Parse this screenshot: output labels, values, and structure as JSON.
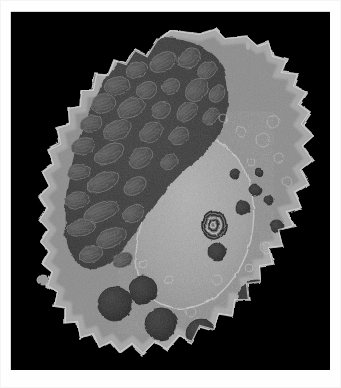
{
  "page": {
    "background_color": "#ffffff",
    "margin_rule_color": "#d8d8d8"
  },
  "figure": {
    "type": "transmission-electron-micrograph",
    "caption": "",
    "frame": {
      "x": 11,
      "y": 12,
      "width": 319,
      "height": 358,
      "background_color": "#000000"
    },
    "palette": {
      "background": "#000000",
      "cytoplasm_light": "#9d9d9d",
      "cytoplasm_mid": "#7e7e7e",
      "nucleus": "#a6a6a6",
      "organelle_field_dark": "#3d3d3d",
      "mitochondria": "#4a4a4a",
      "granules_dense": "#2a2a2a",
      "membrane_highlight": "#c9c9c9"
    },
    "regions": [
      {
        "name": "plasma-membrane-ruffles",
        "label": "Plasma membrane with filopodia / microvilli",
        "tone": "#b5b5b5"
      },
      {
        "name": "mitochondria-field",
        "label": "Dense field of mitochondria and rough ER",
        "tone": "#3f3f3f"
      },
      {
        "name": "nucleus",
        "label": "Nucleus with granular euchromatin",
        "tone": "#a8a8a8"
      },
      {
        "name": "dense-granules",
        "label": "Electron-dense secretory granules / lysosomes",
        "tone": "#2b2b2b"
      },
      {
        "name": "multilamellar-body",
        "label": "Multilamellar (myelin figure) body",
        "tone": "#555555"
      }
    ],
    "cell_outline": "M 160 18 L 188 22 L 205 17 L 214 26 L 236 24 L 247 34 L 258 30 L 262 44 L 276 48 L 271 60 L 287 62 L 283 74 L 296 80 L 288 92 L 299 100 L 291 112 L 303 124 L 292 134 L 302 148 L 290 158 L 298 172 L 284 180 L 291 196 L 276 200 L 283 214 L 268 218 L 272 234 L 258 236 L 262 252 L 249 254 L 250 270 L 236 272 L 238 288 L 224 288 L 222 304 L 208 302 L 203 318 L 189 314 L 181 330 L 168 324 L 156 338 L 144 330 L 132 342 L 121 332 L 109 341 L 100 330 L 88 336 L 82 322 L 69 326 L 66 310 L 54 311 L 54 296 L 43 294 L 46 280 L 36 274 L 41 260 L 31 252 L 38 240 L 29 230 L 37 218 L 28 208 L 36 196 L 28 184 L 38 174 L 31 160 L 42 152 L 37 138 L 49 132 L 46 116 L 58 112 L 57 96 L 69 94 L 70 78 L 82 78 L 85 62 L 97 63 L 103 48 L 115 52 L 124 38 L 136 44 L 146 28 Z",
    "mitochondria_ellipses": [
      {
        "cx": 152,
        "cy": 50,
        "rx": 14,
        "ry": 9,
        "rot": -28,
        "tone": "#4e4e4e"
      },
      {
        "cx": 126,
        "cy": 58,
        "rx": 11,
        "ry": 8,
        "rot": -20,
        "tone": "#4a4a4a"
      },
      {
        "cx": 178,
        "cy": 46,
        "rx": 12,
        "ry": 9,
        "rot": -35,
        "tone": "#535353"
      },
      {
        "cx": 196,
        "cy": 58,
        "rx": 10,
        "ry": 8,
        "rot": -40,
        "tone": "#4d4d4d"
      },
      {
        "cx": 106,
        "cy": 74,
        "rx": 13,
        "ry": 9,
        "rot": -15,
        "tone": "#4c4c4c"
      },
      {
        "cx": 136,
        "cy": 78,
        "rx": 10,
        "ry": 8,
        "rot": -30,
        "tone": "#474747"
      },
      {
        "cx": 160,
        "cy": 74,
        "rx": 9,
        "ry": 7,
        "rot": -25,
        "tone": "#4f4f4f"
      },
      {
        "cx": 186,
        "cy": 78,
        "rx": 13,
        "ry": 10,
        "rot": -45,
        "tone": "#505050"
      },
      {
        "cx": 206,
        "cy": 82,
        "rx": 9,
        "ry": 7,
        "rot": -50,
        "tone": "#484848"
      },
      {
        "cx": 92,
        "cy": 92,
        "rx": 12,
        "ry": 9,
        "rot": -18,
        "tone": "#4b4b4b"
      },
      {
        "cx": 120,
        "cy": 96,
        "rx": 14,
        "ry": 9,
        "rot": -24,
        "tone": "#464646"
      },
      {
        "cx": 150,
        "cy": 98,
        "rx": 10,
        "ry": 8,
        "rot": -32,
        "tone": "#4e4e4e"
      },
      {
        "cx": 176,
        "cy": 100,
        "rx": 11,
        "ry": 8,
        "rot": -38,
        "tone": "#4a4a4a"
      },
      {
        "cx": 200,
        "cy": 104,
        "rx": 9,
        "ry": 7,
        "rot": -44,
        "tone": "#444444"
      },
      {
        "cx": 80,
        "cy": 112,
        "rx": 11,
        "ry": 8,
        "rot": -12,
        "tone": "#494949"
      },
      {
        "cx": 106,
        "cy": 118,
        "rx": 15,
        "ry": 9,
        "rot": -26,
        "tone": "#4d4d4d"
      },
      {
        "cx": 140,
        "cy": 120,
        "rx": 12,
        "ry": 9,
        "rot": -30,
        "tone": "#474747"
      },
      {
        "cx": 168,
        "cy": 124,
        "rx": 10,
        "ry": 8,
        "rot": -36,
        "tone": "#4b4b4b"
      },
      {
        "cx": 72,
        "cy": 134,
        "rx": 12,
        "ry": 8,
        "rot": -14,
        "tone": "#4a4a4a"
      },
      {
        "cx": 98,
        "cy": 142,
        "rx": 16,
        "ry": 9,
        "rot": -28,
        "tone": "#505050"
      },
      {
        "cx": 130,
        "cy": 146,
        "rx": 13,
        "ry": 9,
        "rot": -34,
        "tone": "#464646"
      },
      {
        "cx": 158,
        "cy": 150,
        "rx": 9,
        "ry": 7,
        "rot": -40,
        "tone": "#4c4c4c"
      },
      {
        "cx": 68,
        "cy": 160,
        "rx": 11,
        "ry": 8,
        "rot": -10,
        "tone": "#484848"
      },
      {
        "cx": 92,
        "cy": 170,
        "rx": 17,
        "ry": 9,
        "rot": -26,
        "tone": "#4e4e4e"
      },
      {
        "cx": 124,
        "cy": 174,
        "rx": 12,
        "ry": 8,
        "rot": -32,
        "tone": "#454545"
      },
      {
        "cx": 66,
        "cy": 188,
        "rx": 13,
        "ry": 8,
        "rot": -8,
        "tone": "#4b4b4b"
      },
      {
        "cx": 90,
        "cy": 200,
        "rx": 18,
        "ry": 9,
        "rot": -22,
        "tone": "#4d4d4d"
      },
      {
        "cx": 122,
        "cy": 202,
        "rx": 11,
        "ry": 8,
        "rot": -30,
        "tone": "#474747"
      },
      {
        "cx": 70,
        "cy": 216,
        "rx": 14,
        "ry": 8,
        "rot": -12,
        "tone": "#494949"
      },
      {
        "cx": 100,
        "cy": 226,
        "rx": 15,
        "ry": 9,
        "rot": -24,
        "tone": "#4c4c4c"
      },
      {
        "cx": 80,
        "cy": 242,
        "rx": 12,
        "ry": 8,
        "rot": -18,
        "tone": "#464646"
      },
      {
        "cx": 112,
        "cy": 248,
        "rx": 10,
        "ry": 7,
        "rot": -28,
        "tone": "#4a4a4a"
      }
    ],
    "dense_granules": [
      {
        "cx": 104,
        "cy": 292,
        "r": 17,
        "tone": "#2e2e2e"
      },
      {
        "cx": 132,
        "cy": 278,
        "r": 14,
        "tone": "#323232"
      },
      {
        "cx": 150,
        "cy": 312,
        "r": 16,
        "tone": "#2c2c2c"
      },
      {
        "cx": 190,
        "cy": 322,
        "r": 15,
        "tone": "#303030"
      },
      {
        "cx": 246,
        "cy": 286,
        "r": 18,
        "tone": "#2a2a2a"
      },
      {
        "cx": 206,
        "cy": 240,
        "r": 9,
        "tone": "#262626"
      },
      {
        "cx": 232,
        "cy": 196,
        "r": 7,
        "tone": "#242424"
      },
      {
        "cx": 244,
        "cy": 178,
        "r": 6,
        "tone": "#232323"
      },
      {
        "cx": 258,
        "cy": 188,
        "r": 5,
        "tone": "#262626"
      },
      {
        "cx": 266,
        "cy": 214,
        "r": 6,
        "tone": "#252525"
      },
      {
        "cx": 224,
        "cy": 162,
        "r": 5,
        "tone": "#222222"
      },
      {
        "cx": 248,
        "cy": 160,
        "r": 4,
        "tone": "#242424"
      }
    ],
    "multilamellar_body": {
      "cx": 203,
      "cy": 213,
      "rx": 12,
      "ry": 14,
      "rings": 4
    }
  }
}
